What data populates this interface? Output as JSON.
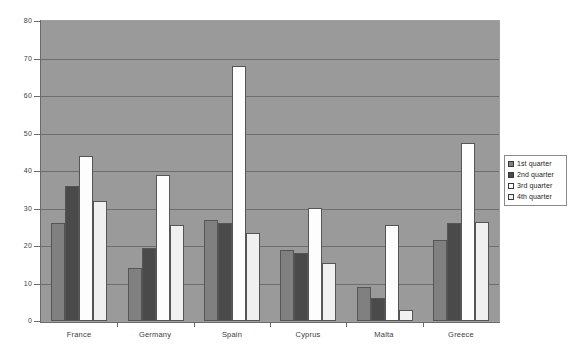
{
  "chart_data": {
    "type": "bar",
    "title": "",
    "subtitle": "",
    "xlabel": "",
    "ylabel": "",
    "ylim": [
      0,
      80
    ],
    "yticks": [
      0,
      10,
      20,
      30,
      40,
      50,
      60,
      70,
      80
    ],
    "ytick_labels": [
      "0",
      "10",
      "20",
      "30",
      "40",
      "50",
      "60",
      "70",
      "80"
    ],
    "grid": true,
    "grid_axis": "y",
    "legend_position": "right",
    "categories": [
      "France",
      "Germany",
      "Spain",
      "Cyprus",
      "Malta",
      "Greece"
    ],
    "series": [
      {
        "name": "1st quarter",
        "color": "#808080",
        "values": [
          26,
          14,
          27,
          19,
          9,
          21.5
        ]
      },
      {
        "name": "2nd quarter",
        "color": "#4a4a4a",
        "values": [
          36,
          19.5,
          26,
          18,
          6,
          26
        ]
      },
      {
        "name": "3rd quarter",
        "color": "#fdfdfd",
        "values": [
          44,
          39,
          68,
          30,
          25.5,
          47.5
        ]
      },
      {
        "name": "4th quarter",
        "color": "#f0f0f0",
        "values": [
          32,
          25.5,
          23.5,
          15.5,
          3,
          26.5
        ]
      }
    ]
  },
  "legend": {
    "entries": [
      {
        "label": "1st quarter",
        "color": "#808080"
      },
      {
        "label": "2nd quarter",
        "color": "#4a4a4a"
      },
      {
        "label": "3rd quarter",
        "color": "#fdfdfd"
      },
      {
        "label": "4th quarter",
        "color": "#f0f0f0"
      }
    ]
  },
  "colors": {
    "plot_background": "#9a9a9a",
    "page_background": "#ffffff",
    "gridline": "#6e6e6e",
    "axis": "#6a6a6a",
    "text": "#3d3d3d",
    "bar_border": "#555555"
  }
}
